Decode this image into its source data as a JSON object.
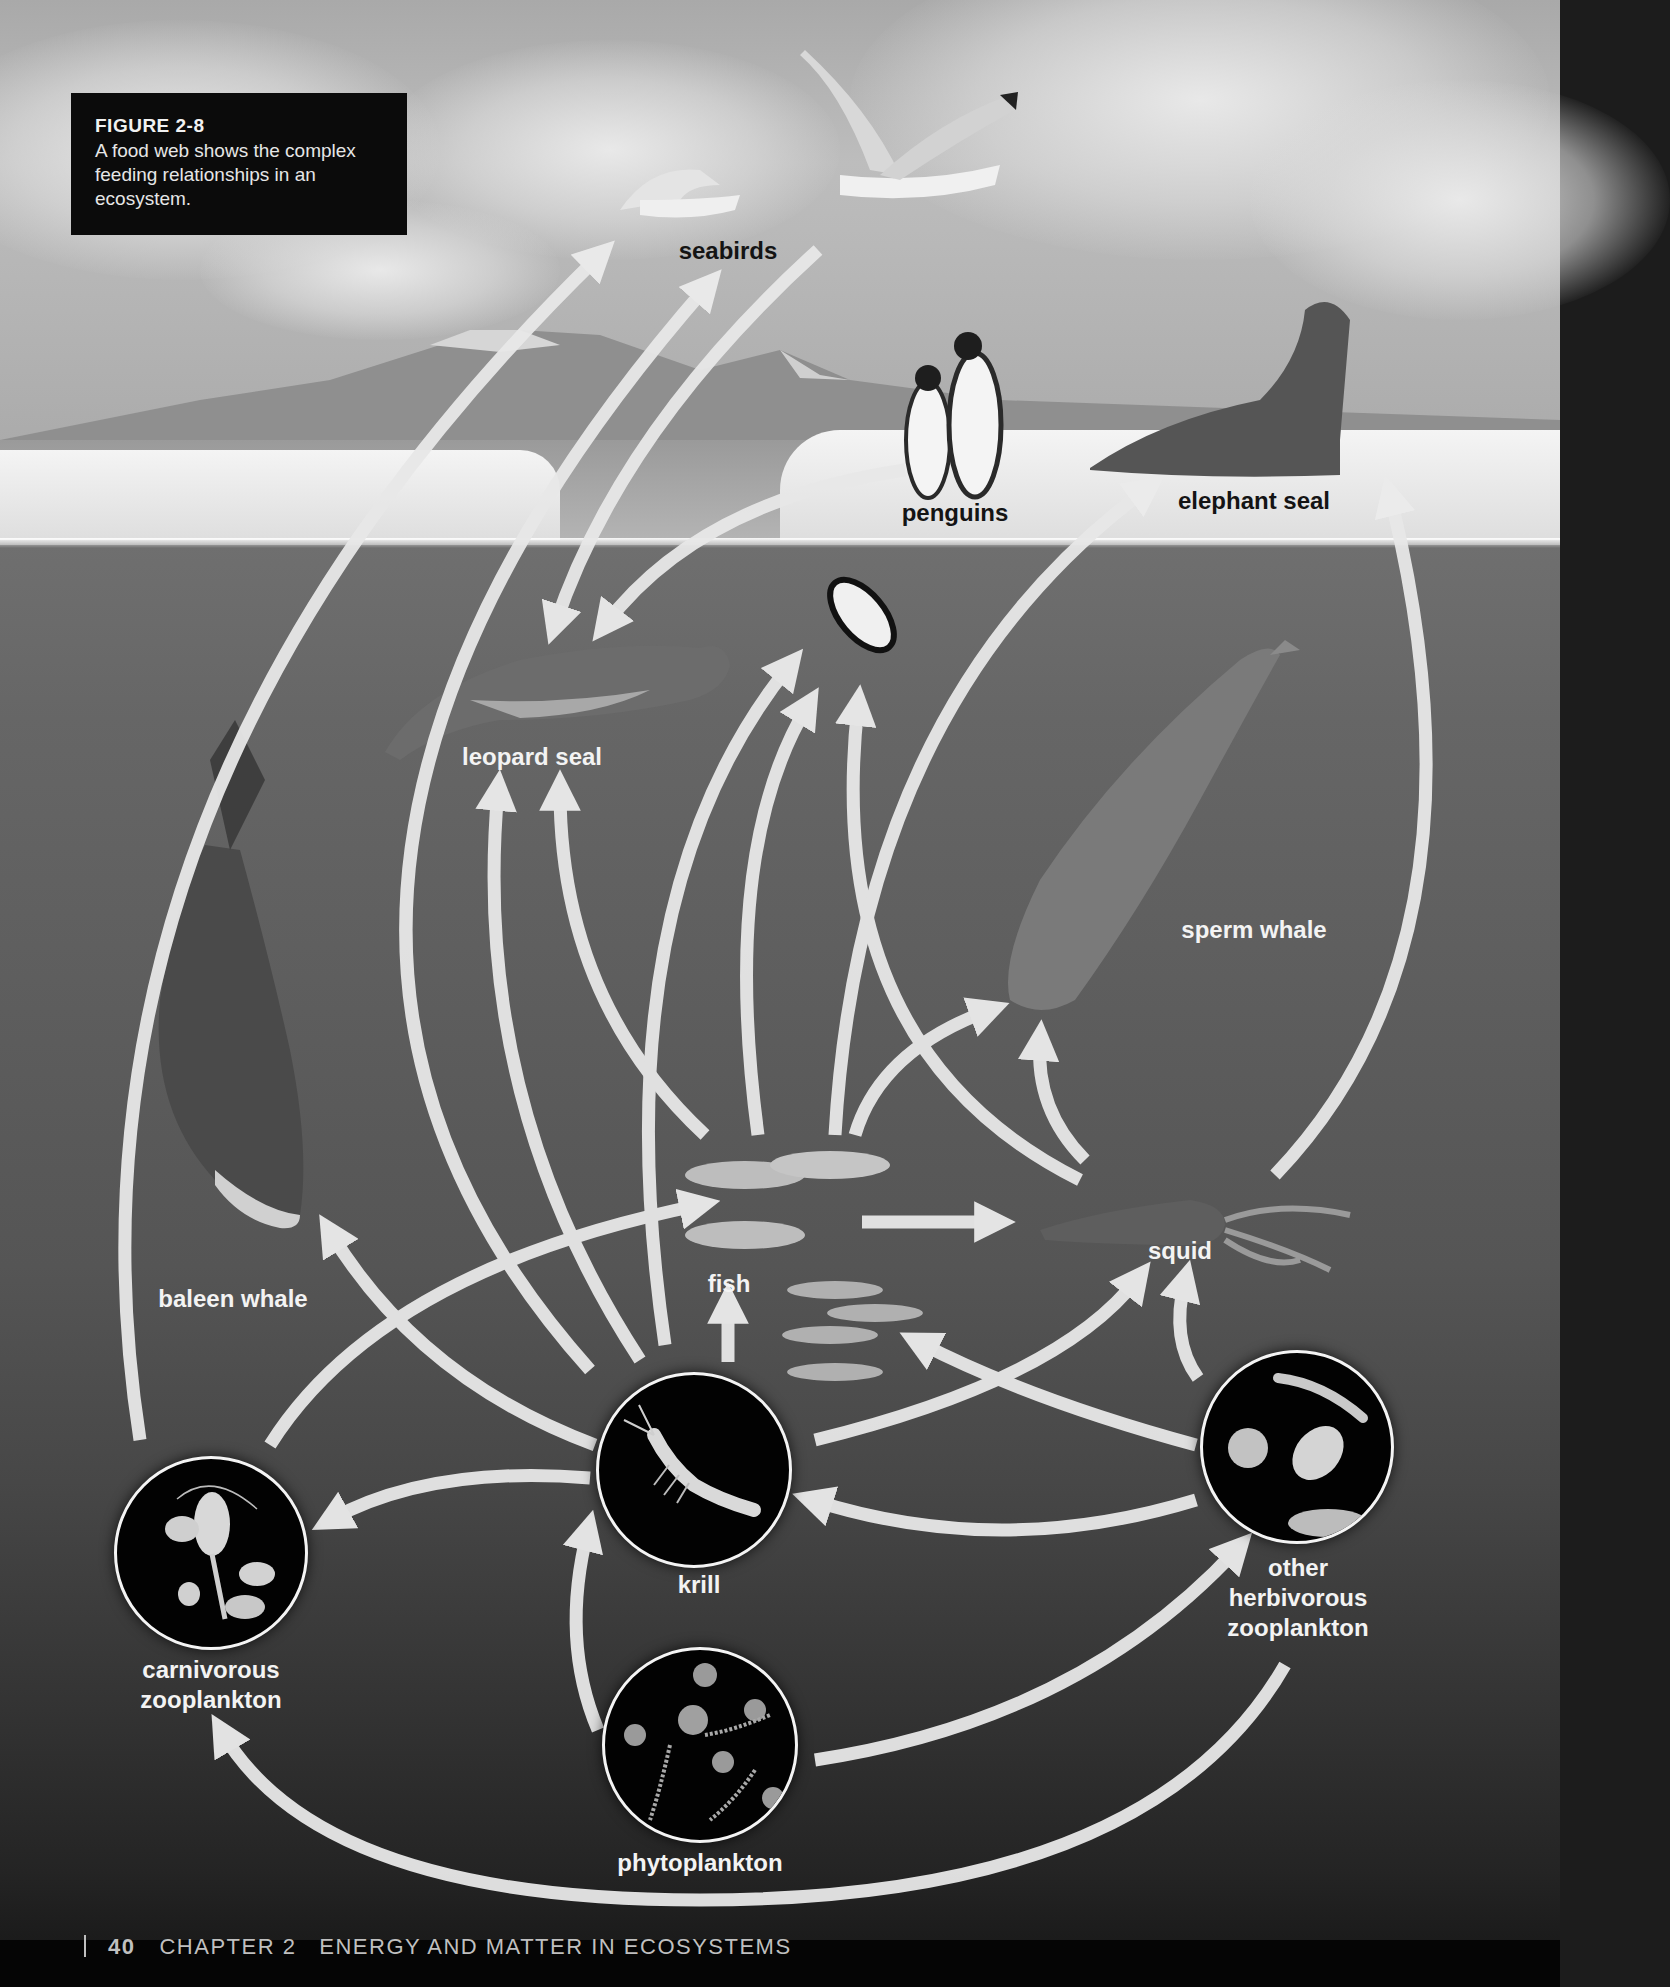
{
  "caption": {
    "figure_label": "FIGURE 2-8",
    "text": "A food web shows the complex feeding relationships in an ecosystem."
  },
  "organisms": {
    "seabirds": "seabirds",
    "penguins": "penguins",
    "elephant_seal": "elephant seal",
    "leopard_seal": "leopard seal",
    "sperm_whale": "sperm whale",
    "baleen_whale": "baleen whale",
    "fish": "fish",
    "squid": "squid",
    "krill": "krill",
    "carnivorous_zooplankton": [
      "carnivorous",
      "zooplankton"
    ],
    "other_herbivorous_zooplankton": [
      "other",
      "herbivorous",
      "zooplankton"
    ],
    "phytoplankton": "phytoplankton"
  },
  "feeding_links": [
    {
      "from": "phytoplankton",
      "to": "krill"
    },
    {
      "from": "phytoplankton",
      "to": "other herbivorous zooplankton"
    },
    {
      "from": "other herbivorous zooplankton",
      "to": "carnivorous zooplankton"
    },
    {
      "from": "other herbivorous zooplankton",
      "to": "krill"
    },
    {
      "from": "other herbivorous zooplankton",
      "to": "fish"
    },
    {
      "from": "other herbivorous zooplankton",
      "to": "squid"
    },
    {
      "from": "krill",
      "to": "carnivorous zooplankton"
    },
    {
      "from": "krill",
      "to": "fish"
    },
    {
      "from": "krill",
      "to": "squid"
    },
    {
      "from": "krill",
      "to": "baleen whale"
    },
    {
      "from": "krill",
      "to": "leopard seal"
    },
    {
      "from": "krill",
      "to": "penguins"
    },
    {
      "from": "krill",
      "to": "seabirds"
    },
    {
      "from": "carnivorous zooplankton",
      "to": "fish"
    },
    {
      "from": "carnivorous zooplankton",
      "to": "seabirds"
    },
    {
      "from": "fish",
      "to": "squid"
    },
    {
      "from": "fish",
      "to": "sperm whale"
    },
    {
      "from": "fish",
      "to": "leopard seal"
    },
    {
      "from": "fish",
      "to": "penguins"
    },
    {
      "from": "fish",
      "to": "elephant seal"
    },
    {
      "from": "squid",
      "to": "sperm whale"
    },
    {
      "from": "squid",
      "to": "elephant seal"
    },
    {
      "from": "squid",
      "to": "penguins"
    },
    {
      "from": "seabirds",
      "to": "leopard seal"
    },
    {
      "from": "penguins",
      "to": "leopard seal"
    }
  ],
  "footer": {
    "page_number": "40",
    "chapter": "CHAPTER 2",
    "chapter_title": "ENERGY AND MATTER IN ECOSYSTEMS"
  },
  "colors": {
    "arrow": "#e8e8e8",
    "caption_bg": "#0b0b0b",
    "label_light": "#f3f3f3",
    "label_dark": "#141414"
  }
}
